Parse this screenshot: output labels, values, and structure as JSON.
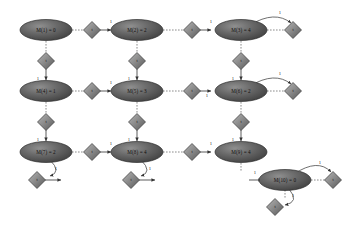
{
  "figure": {
    "type": "reachability-graph",
    "background": "#ffffff",
    "width": 352,
    "height": 225,
    "node_fill_dark": "#4a4a4a",
    "node_fill_light": "#a8a8a8",
    "edge_color": "#4a4a4a"
  },
  "places": [
    {
      "id": "p1",
      "label": "M(1) = 0",
      "x": 46,
      "y": 30
    },
    {
      "id": "p2",
      "label": "M(2) = 2",
      "x": 137,
      "y": 30
    },
    {
      "id": "p3",
      "label": "M(3) = 4",
      "x": 241,
      "y": 30
    },
    {
      "id": "p4",
      "label": "M(4) = 1",
      "x": 46,
      "y": 91
    },
    {
      "id": "p5",
      "label": "M(5) = 3",
      "x": 137,
      "y": 91
    },
    {
      "id": "p6",
      "label": "M(6) = 2",
      "x": 241,
      "y": 91
    },
    {
      "id": "p7",
      "label": "M(7) = 2",
      "x": 46,
      "y": 152
    },
    {
      "id": "p8",
      "label": "M(8) = 4",
      "x": 137,
      "y": 152
    },
    {
      "id": "p9",
      "label": "M(9) = 4",
      "x": 241,
      "y": 152
    },
    {
      "id": "p10",
      "label": "M(10) = 0",
      "x": 285,
      "y": 180
    }
  ],
  "transitions": [
    {
      "id": "t1",
      "label": "t",
      "x": 92,
      "y": 30
    },
    {
      "id": "t2",
      "label": "t",
      "x": 192,
      "y": 30
    },
    {
      "id": "t3",
      "label": "t",
      "x": 293,
      "y": 30
    },
    {
      "id": "t4",
      "label": "t",
      "x": 46,
      "y": 61
    },
    {
      "id": "t5",
      "label": "t",
      "x": 137,
      "y": 61
    },
    {
      "id": "t6",
      "label": "t",
      "x": 241,
      "y": 61
    },
    {
      "id": "t7",
      "label": "t",
      "x": 92,
      "y": 91
    },
    {
      "id": "t8",
      "label": "t",
      "x": 192,
      "y": 91
    },
    {
      "id": "t9",
      "label": "t",
      "x": 293,
      "y": 91
    },
    {
      "id": "t10",
      "label": "t",
      "x": 46,
      "y": 122
    },
    {
      "id": "t11",
      "label": "t",
      "x": 137,
      "y": 122
    },
    {
      "id": "t12",
      "label": "t",
      "x": 241,
      "y": 122
    },
    {
      "id": "t13",
      "label": "t",
      "x": 92,
      "y": 152
    },
    {
      "id": "t14",
      "label": "t",
      "x": 192,
      "y": 152
    },
    {
      "id": "t15",
      "label": "t",
      "x": 37,
      "y": 180
    },
    {
      "id": "t16",
      "label": "t",
      "x": 131,
      "y": 180
    },
    {
      "id": "t17",
      "label": "t",
      "x": 333,
      "y": 180
    },
    {
      "id": "t18",
      "label": "t",
      "x": 275,
      "y": 207
    }
  ],
  "edge_weights": {
    "default": "1",
    "values": [
      "1",
      "1",
      "1",
      "1",
      "1",
      "1",
      "1",
      "1",
      "1",
      "1",
      "1",
      "1",
      "1",
      "1",
      "1",
      "1",
      "1",
      "1",
      "1",
      "1",
      "1",
      "1"
    ]
  },
  "weight_markers": [
    {
      "text": "1",
      "x": 111,
      "y": 22
    },
    {
      "text": "1",
      "x": 211,
      "y": 22
    },
    {
      "text": "1",
      "x": 280,
      "y": 13
    },
    {
      "text": "1",
      "x": 38,
      "y": 79
    },
    {
      "text": "1",
      "x": 129,
      "y": 79
    },
    {
      "text": "1",
      "x": 233,
      "y": 79
    },
    {
      "text": "1",
      "x": 111,
      "y": 83
    },
    {
      "text": "1",
      "x": 207,
      "y": 96
    },
    {
      "text": "1",
      "x": 280,
      "y": 74
    },
    {
      "text": "1",
      "x": 38,
      "y": 140
    },
    {
      "text": "1",
      "x": 129,
      "y": 140
    },
    {
      "text": "1",
      "x": 233,
      "y": 140
    },
    {
      "text": "1",
      "x": 111,
      "y": 144
    },
    {
      "text": "1",
      "x": 211,
      "y": 144
    },
    {
      "text": "1",
      "x": 56,
      "y": 169
    },
    {
      "text": "1",
      "x": 150,
      "y": 169
    },
    {
      "text": "1",
      "x": 255,
      "y": 173
    },
    {
      "text": "1",
      "x": 320,
      "y": 163
    },
    {
      "text": "1",
      "x": 293,
      "y": 196
    }
  ]
}
